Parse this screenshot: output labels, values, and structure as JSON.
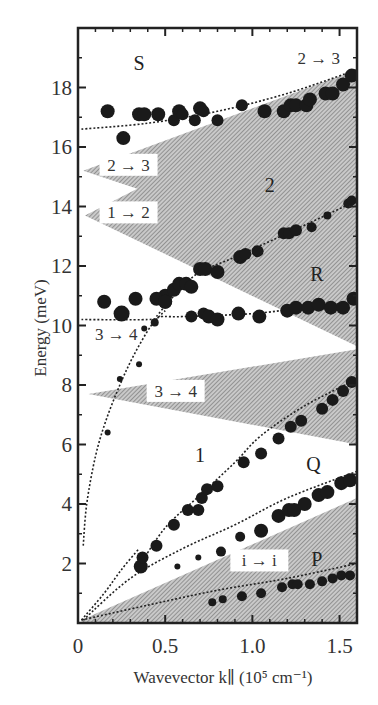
{
  "chart_data": {
    "type": "scatter",
    "title": "",
    "xlabel": "Wavevector k∥ (10⁵ cm⁻¹)",
    "ylabel": "Energy (meV)",
    "xlim": [
      0,
      1.6
    ],
    "ylim": [
      0,
      20
    ],
    "grid": false,
    "legend": null,
    "x_ticks": [
      {
        "value": 0,
        "label": "0"
      },
      {
        "value": 0.5,
        "label": "0.5"
      },
      {
        "value": 1.0,
        "label": "1.0"
      },
      {
        "value": 1.5,
        "label": "1.5"
      }
    ],
    "y_ticks": [
      {
        "value": 2,
        "label": "2"
      },
      {
        "value": 4,
        "label": "4"
      },
      {
        "value": 6,
        "label": "6"
      },
      {
        "value": 8,
        "label": "8"
      },
      {
        "value": 10,
        "label": "10"
      },
      {
        "value": 12,
        "label": "12"
      },
      {
        "value": 14,
        "label": "14"
      },
      {
        "value": 16,
        "label": "16"
      },
      {
        "value": 18,
        "label": "18"
      }
    ],
    "shaded_regions": [
      {
        "name": "continuum-2to3-1to2",
        "points": [
          [
            1.6,
            18.6
          ],
          [
            0.03,
            15.2
          ],
          [
            0.34,
            14.6
          ],
          [
            0.04,
            13.7
          ],
          [
            1.6,
            9.3
          ]
        ]
      },
      {
        "name": "continuum-3to4",
        "points": [
          [
            0.06,
            7.7
          ],
          [
            1.6,
            9.2
          ],
          [
            1.6,
            6.0
          ]
        ]
      },
      {
        "name": "continuum-i-to-i",
        "points": [
          [
            0.02,
            0.1
          ],
          [
            1.6,
            4.2
          ],
          [
            1.6,
            0.0
          ],
          [
            0.02,
            0.0
          ]
        ]
      }
    ],
    "dashed_curves": [
      {
        "name": "S",
        "points": [
          [
            0.02,
            16.6
          ],
          [
            0.4,
            16.8
          ],
          [
            0.8,
            17.2
          ],
          [
            1.2,
            17.8
          ],
          [
            1.6,
            18.6
          ]
        ]
      },
      {
        "name": "branch-2-upper",
        "points": [
          [
            0.45,
            10.3
          ],
          [
            0.52,
            10.8
          ],
          [
            0.6,
            11.3
          ],
          [
            0.7,
            11.8
          ],
          [
            0.9,
            12.3
          ],
          [
            1.2,
            13.1
          ],
          [
            1.6,
            14.2
          ]
        ]
      },
      {
        "name": "R",
        "points": [
          [
            0.02,
            10.2
          ],
          [
            0.4,
            10.2
          ],
          [
            0.48,
            10.3
          ],
          [
            0.6,
            10.3
          ],
          [
            1.0,
            10.4
          ],
          [
            1.3,
            10.6
          ],
          [
            1.6,
            10.8
          ]
        ]
      },
      {
        "name": "steep-plasmon",
        "points": [
          [
            0.03,
            2.6
          ],
          [
            0.05,
            4.0
          ],
          [
            0.1,
            5.6
          ],
          [
            0.16,
            6.8
          ],
          [
            0.24,
            8.0
          ],
          [
            0.32,
            9.0
          ],
          [
            0.42,
            10.0
          ],
          [
            0.5,
            10.5
          ]
        ]
      },
      {
        "name": "branch-1",
        "points": [
          [
            0.35,
            1.9
          ],
          [
            0.5,
            3.2
          ],
          [
            0.7,
            4.3
          ],
          [
            0.9,
            5.4
          ],
          [
            1.05,
            6.3
          ],
          [
            1.3,
            7.3
          ],
          [
            1.6,
            8.2
          ]
        ]
      },
      {
        "name": "Q",
        "points": [
          [
            0.03,
            0.1
          ],
          [
            0.3,
            1.5
          ],
          [
            0.6,
            2.5
          ],
          [
            0.9,
            3.3
          ],
          [
            1.2,
            4.2
          ],
          [
            1.6,
            5.1
          ]
        ]
      },
      {
        "name": "P",
        "points": [
          [
            0.02,
            0.1
          ],
          [
            0.4,
            0.6
          ],
          [
            0.8,
            1.1
          ],
          [
            1.2,
            1.5
          ],
          [
            1.6,
            2.0
          ]
        ]
      },
      {
        "name": "origin-lower",
        "points": [
          [
            0.02,
            0.1
          ],
          [
            0.15,
            1.0
          ],
          [
            0.25,
            1.8
          ],
          [
            0.35,
            2.5
          ]
        ]
      }
    ],
    "series": [
      {
        "name": "S",
        "points": [
          [
            0.17,
            17.2,
            7
          ],
          [
            0.26,
            16.3,
            7
          ],
          [
            0.35,
            17.1,
            7
          ],
          [
            0.38,
            17.1,
            7
          ],
          [
            0.46,
            17.1,
            7
          ],
          [
            0.55,
            16.9,
            6
          ],
          [
            0.58,
            17.2,
            7
          ],
          [
            0.6,
            17.1,
            6
          ],
          [
            0.67,
            16.9,
            6
          ],
          [
            0.7,
            17.3,
            7
          ],
          [
            0.72,
            17.2,
            6
          ],
          [
            0.8,
            16.9,
            6
          ],
          [
            0.94,
            17.4,
            6
          ],
          [
            1.07,
            17.2,
            7
          ],
          [
            1.18,
            17.2,
            7
          ],
          [
            1.22,
            17.4,
            7
          ],
          [
            1.25,
            17.4,
            7
          ],
          [
            1.31,
            17.4,
            7
          ],
          [
            1.33,
            17.6,
            7
          ],
          [
            1.42,
            17.8,
            7
          ],
          [
            1.46,
            17.8,
            7
          ],
          [
            1.52,
            18.1,
            7
          ],
          [
            1.57,
            18.4,
            7
          ]
        ]
      },
      {
        "name": "2",
        "points": [
          [
            0.5,
            11.0,
            7
          ],
          [
            0.55,
            11.2,
            7
          ],
          [
            0.58,
            11.4,
            7
          ],
          [
            0.62,
            11.4,
            7
          ],
          [
            0.65,
            11.3,
            7
          ],
          [
            0.7,
            11.9,
            7
          ],
          [
            0.73,
            11.9,
            7
          ],
          [
            0.8,
            11.8,
            7
          ],
          [
            0.93,
            12.3,
            7
          ],
          [
            0.96,
            12.4,
            6
          ],
          [
            1.03,
            12.5,
            6
          ],
          [
            1.18,
            13.1,
            6
          ],
          [
            1.21,
            13.1,
            6
          ],
          [
            1.25,
            13.2,
            6
          ],
          [
            1.34,
            13.3,
            5
          ],
          [
            1.43,
            13.7,
            4
          ],
          [
            1.55,
            14.1,
            5
          ],
          [
            1.57,
            14.2,
            5
          ]
        ]
      },
      {
        "name": "R",
        "points": [
          [
            0.15,
            10.8,
            7
          ],
          [
            0.25,
            10.4,
            8
          ],
          [
            0.33,
            10.9,
            7
          ],
          [
            0.45,
            10.9,
            7
          ],
          [
            0.5,
            10.8,
            7
          ],
          [
            0.5,
            10.8,
            7
          ],
          [
            0.65,
            10.3,
            6
          ],
          [
            0.72,
            10.4,
            6
          ],
          [
            0.75,
            10.3,
            7
          ],
          [
            0.8,
            10.2,
            7
          ],
          [
            0.92,
            10.4,
            7
          ],
          [
            1.04,
            10.3,
            7
          ],
          [
            1.2,
            10.5,
            7
          ],
          [
            1.25,
            10.6,
            7
          ],
          [
            1.32,
            10.6,
            7
          ],
          [
            1.38,
            10.7,
            7
          ],
          [
            1.45,
            10.6,
            7
          ],
          [
            1.52,
            10.6,
            7
          ],
          [
            1.58,
            10.9,
            7
          ]
        ]
      },
      {
        "name": "steep",
        "points": [
          [
            0.17,
            6.4,
            3
          ],
          [
            0.24,
            8.2,
            3
          ],
          [
            0.35,
            8.7,
            3
          ],
          [
            0.38,
            9.9,
            3
          ],
          [
            0.44,
            10.1,
            4
          ]
        ]
      },
      {
        "name": "1",
        "points": [
          [
            0.36,
            1.9,
            7
          ],
          [
            0.37,
            2.2,
            6
          ],
          [
            0.45,
            2.6,
            6
          ],
          [
            0.55,
            3.3,
            6
          ],
          [
            0.63,
            3.8,
            6
          ],
          [
            0.69,
            3.8,
            6
          ],
          [
            0.71,
            4.2,
            6
          ],
          [
            0.74,
            4.5,
            6
          ],
          [
            0.8,
            4.6,
            6
          ],
          [
            0.95,
            5.4,
            6
          ],
          [
            1.05,
            5.7,
            6
          ],
          [
            1.15,
            6.2,
            6
          ],
          [
            1.22,
            6.6,
            6
          ],
          [
            1.28,
            6.8,
            6
          ],
          [
            1.4,
            7.2,
            6
          ],
          [
            1.46,
            7.5,
            6
          ],
          [
            1.52,
            7.8,
            6
          ],
          [
            1.57,
            8.1,
            6
          ]
        ]
      },
      {
        "name": "Q",
        "points": [
          [
            0.57,
            1.9,
            3
          ],
          [
            0.69,
            2.2,
            3
          ],
          [
            0.82,
            2.4,
            5
          ],
          [
            0.93,
            2.9,
            5
          ],
          [
            1.05,
            3.1,
            7
          ],
          [
            1.15,
            3.6,
            7
          ],
          [
            1.21,
            3.8,
            7
          ],
          [
            1.24,
            3.8,
            7
          ],
          [
            1.3,
            4.0,
            7
          ],
          [
            1.38,
            4.3,
            7
          ],
          [
            1.43,
            4.4,
            7
          ],
          [
            1.51,
            4.7,
            7
          ],
          [
            1.56,
            4.8,
            7
          ]
        ]
      },
      {
        "name": "P",
        "points": [
          [
            0.77,
            0.7,
            4
          ],
          [
            0.83,
            0.8,
            4
          ],
          [
            0.94,
            0.9,
            5
          ],
          [
            1.05,
            1.0,
            5
          ],
          [
            1.17,
            1.2,
            5
          ],
          [
            1.23,
            1.3,
            5
          ],
          [
            1.26,
            1.3,
            5
          ],
          [
            1.33,
            1.3,
            5
          ],
          [
            1.4,
            1.4,
            5
          ],
          [
            1.46,
            1.5,
            5
          ],
          [
            1.51,
            1.6,
            5
          ],
          [
            1.56,
            1.6,
            5
          ]
        ]
      }
    ],
    "annotations": {
      "region_labels": [
        {
          "text": "S",
          "x": 0.35,
          "y": 18.6
        },
        {
          "text": "2",
          "x": 1.1,
          "y": 14.5
        },
        {
          "text": "R",
          "x": 1.37,
          "y": 11.5
        },
        {
          "text": "1",
          "x": 0.7,
          "y": 5.4
        },
        {
          "text": "Q",
          "x": 1.35,
          "y": 5.1
        },
        {
          "text": "P",
          "x": 1.37,
          "y": 1.9
        }
      ],
      "transition_labels": [
        {
          "text": "2 → 3",
          "x": 1.38,
          "y": 18.8,
          "boxed": false
        },
        {
          "text": "2 → 3",
          "x": 0.29,
          "y": 15.2,
          "boxed": true
        },
        {
          "text": "1 → 2",
          "x": 0.29,
          "y": 13.6,
          "boxed": true
        },
        {
          "text": "3 → 4",
          "x": 0.22,
          "y": 9.5,
          "boxed": false
        },
        {
          "text": "3 → 4",
          "x": 0.56,
          "y": 7.6,
          "boxed": true
        },
        {
          "text": "i → i",
          "x": 1.04,
          "y": 1.9,
          "boxed": true
        }
      ]
    }
  },
  "axes": {
    "xlabel": "Wavevector k∥ (10⁵ cm⁻¹)",
    "ylabel": "Energy (meV)"
  }
}
